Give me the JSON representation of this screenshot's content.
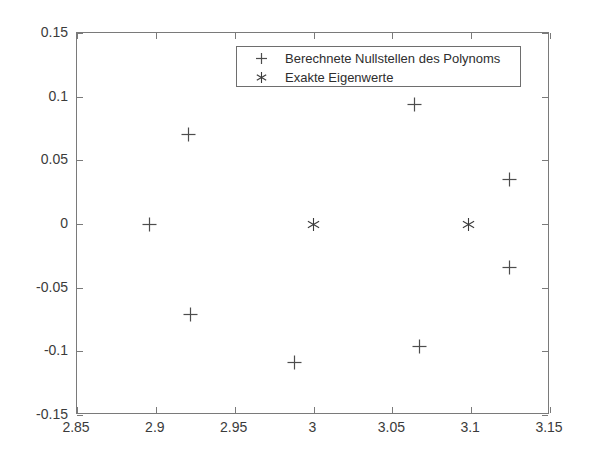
{
  "chart_data": {
    "type": "scatter",
    "title": "",
    "xlabel": "",
    "ylabel": "",
    "xlim": [
      2.85,
      3.15
    ],
    "ylim": [
      -0.15,
      0.15
    ],
    "grid": false,
    "legend_position": "top-center",
    "xticks": [
      "2.85",
      "2.9",
      "2.95",
      "3",
      "3.05",
      "3.1",
      "3.15"
    ],
    "xtick_values": [
      2.85,
      2.9,
      2.95,
      3.0,
      3.05,
      3.1,
      3.15
    ],
    "yticks": [
      "0.15",
      "0.1",
      "0.05",
      "0",
      "-0.05",
      "-0.1",
      "-0.15"
    ],
    "ytick_values": [
      0.15,
      0.1,
      0.05,
      0,
      -0.05,
      -0.1,
      -0.15
    ],
    "series": [
      {
        "name": "Berechnete Nullstellen des Polynoms",
        "marker": "plus",
        "color": "#4d4d4d",
        "points": [
          {
            "x": 2.896,
            "y": 0.0
          },
          {
            "x": 2.921,
            "y": 0.07
          },
          {
            "x": 2.922,
            "y": -0.071
          },
          {
            "x": 2.988,
            "y": -0.109
          },
          {
            "x": 3.064,
            "y": 0.094
          },
          {
            "x": 3.067,
            "y": -0.096
          },
          {
            "x": 3.124,
            "y": 0.035
          },
          {
            "x": 3.124,
            "y": -0.034
          }
        ]
      },
      {
        "name": "Exakte Eigenwerte",
        "marker": "asterisk",
        "color": "#3b3b3b",
        "points": [
          {
            "x": 3.0,
            "y": 0.0
          },
          {
            "x": 3.098,
            "y": 0.0
          }
        ]
      }
    ]
  },
  "legend": {
    "entries": [
      {
        "symbol": "plus",
        "label": "Berechnete Nullstellen des Polynoms"
      },
      {
        "symbol": "asterisk",
        "label": "Exakte Eigenwerte"
      }
    ]
  },
  "colors": {
    "axis": "#7a7a7a",
    "text": "#3b3b3b",
    "marker": "#4d4d4d",
    "background": "#ffffff"
  }
}
